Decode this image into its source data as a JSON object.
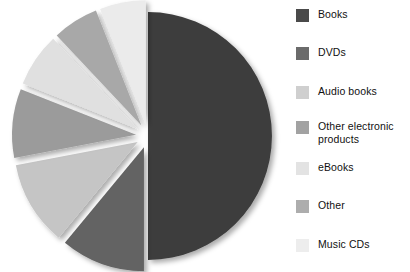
{
  "chart_data": {
    "type": "pie",
    "title": "",
    "subtitle": "",
    "exploded": true,
    "legend_position": "right",
    "grid": false,
    "categories": [
      "Books",
      "DVDs",
      "Audio books",
      "Other electronic products",
      "eBooks",
      "Other",
      "Music CDs"
    ],
    "values": [
      50,
      11,
      11,
      9,
      7,
      6,
      5
    ],
    "unit": "%",
    "colors": [
      "#3d3d3d",
      "#636363",
      "#c5c5c5",
      "#9b9b9b",
      "#e0e0e0",
      "#a8a8a8",
      "#ebebeb"
    ],
    "series": [
      {
        "name": "Share of product category",
        "values": [
          50,
          11,
          11,
          9,
          7,
          6,
          5
        ]
      }
    ],
    "slices": [
      {
        "label": "Books",
        "value": 50,
        "color": "#3d3d3d",
        "start_angle": 0,
        "end_angle": 180,
        "explode": 0
      },
      {
        "label": "DVDs",
        "value": 11,
        "color": "#636363",
        "start_angle": 180,
        "end_angle": 219.6,
        "explode": 12
      },
      {
        "label": "Audio books",
        "value": 11,
        "color": "#c5c5c5",
        "start_angle": 219.6,
        "end_angle": 259.2,
        "explode": 12
      },
      {
        "label": "Other electronic products",
        "value": 9,
        "color": "#9b9b9b",
        "start_angle": 259.2,
        "end_angle": 291.6,
        "explode": 12
      },
      {
        "label": "eBooks",
        "value": 7,
        "color": "#e0e0e0",
        "start_angle": 291.6,
        "end_angle": 316.8,
        "explode": 12
      },
      {
        "label": "Other",
        "value": 6,
        "color": "#a8a8a8",
        "start_angle": 316.8,
        "end_angle": 338.4,
        "explode": 12
      },
      {
        "label": "Music CDs",
        "value": 5,
        "color": "#ebebeb",
        "start_angle": 338.4,
        "end_angle": 360,
        "explode": 12
      }
    ],
    "xlabel": "",
    "ylabel": ""
  },
  "legend": {
    "items": [
      {
        "label": "Books",
        "color": "#4a4a4a"
      },
      {
        "label": "DVDs",
        "color": "#6b6b6b"
      },
      {
        "label": "Audio books",
        "color": "#cfcfcf"
      },
      {
        "label": "Other electronic\nproducts",
        "color": "#a2a2a2"
      },
      {
        "label": "eBooks",
        "color": "#e3e3e3"
      },
      {
        "label": "Other",
        "color": "#adadad"
      },
      {
        "label": "Music CDs",
        "color": "#ededed"
      }
    ]
  }
}
